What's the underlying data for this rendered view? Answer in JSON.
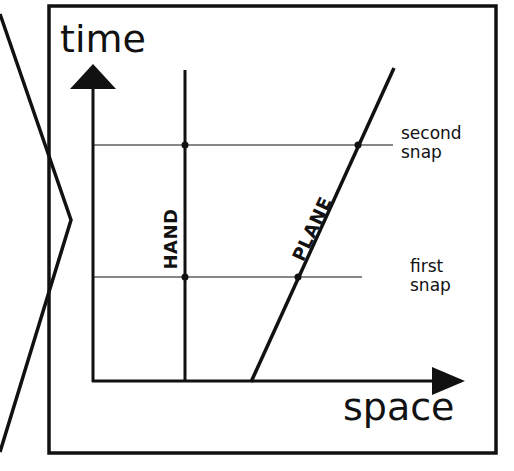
{
  "diagram": {
    "type": "spacetime-diagram",
    "axes": {
      "vertical_label": "time",
      "horizontal_label": "space"
    },
    "worldlines": [
      {
        "label": "HAND",
        "orientation": "vertical"
      },
      {
        "label": "PLANE",
        "orientation": "slanted"
      }
    ],
    "events": [
      {
        "label_line1": "second",
        "label_line2": "snap"
      },
      {
        "label_line1": "first",
        "label_line2": "snap"
      }
    ],
    "colors": {
      "ink": "#111111",
      "background": "#ffffff"
    }
  }
}
